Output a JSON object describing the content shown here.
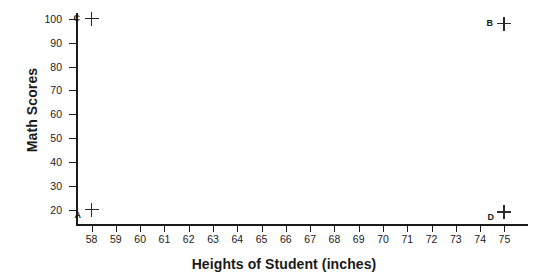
{
  "chart_data": {
    "type": "scatter",
    "title": "",
    "xlabel": "Heights of Student (inches)",
    "ylabel": "Math Scores",
    "xlim": [
      57.4,
      75.6
    ],
    "ylim": [
      14,
      102
    ],
    "grid": false,
    "legend": "none",
    "marker": "plus",
    "xticks": [
      58,
      59,
      60,
      61,
      62,
      63,
      64,
      65,
      66,
      67,
      68,
      69,
      70,
      71,
      72,
      73,
      74,
      75
    ],
    "yticks": [
      20,
      30,
      40,
      50,
      60,
      70,
      80,
      90,
      100
    ],
    "points": [
      {
        "label": "C",
        "x": 58,
        "y": 100,
        "label_pos": "left"
      },
      {
        "label": "B",
        "x": 75,
        "y": 98,
        "label_pos": "left"
      },
      {
        "label": "A",
        "x": 58,
        "y": 20,
        "label_pos": "lower-left"
      },
      {
        "label": "D",
        "x": 75,
        "y": 19,
        "label_pos": "lower-left"
      }
    ],
    "colors": {
      "axis": "#1a1a1a",
      "marker": "#2a2a2a",
      "background": "#ffffff"
    }
  }
}
